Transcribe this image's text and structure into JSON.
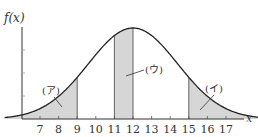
{
  "figure": {
    "y_axis_label": "f(x)",
    "x_axis_label": "x",
    "x_ticks": [
      "7",
      "8",
      "9",
      "10",
      "11",
      "12",
      "13",
      "14",
      "15",
      "16",
      "17"
    ],
    "regions": [
      {
        "label": "(ア)",
        "from": "left tail",
        "to": "9"
      },
      {
        "label": "(ウ)",
        "from": "11",
        "to": "12"
      },
      {
        "label": "(イ)",
        "from": "15",
        "to": "right tail"
      }
    ],
    "curve": "normal distribution, mean 12",
    "colors": {
      "curve": "#222222",
      "shade": "#d6d6d6",
      "axis": "#333333"
    }
  }
}
